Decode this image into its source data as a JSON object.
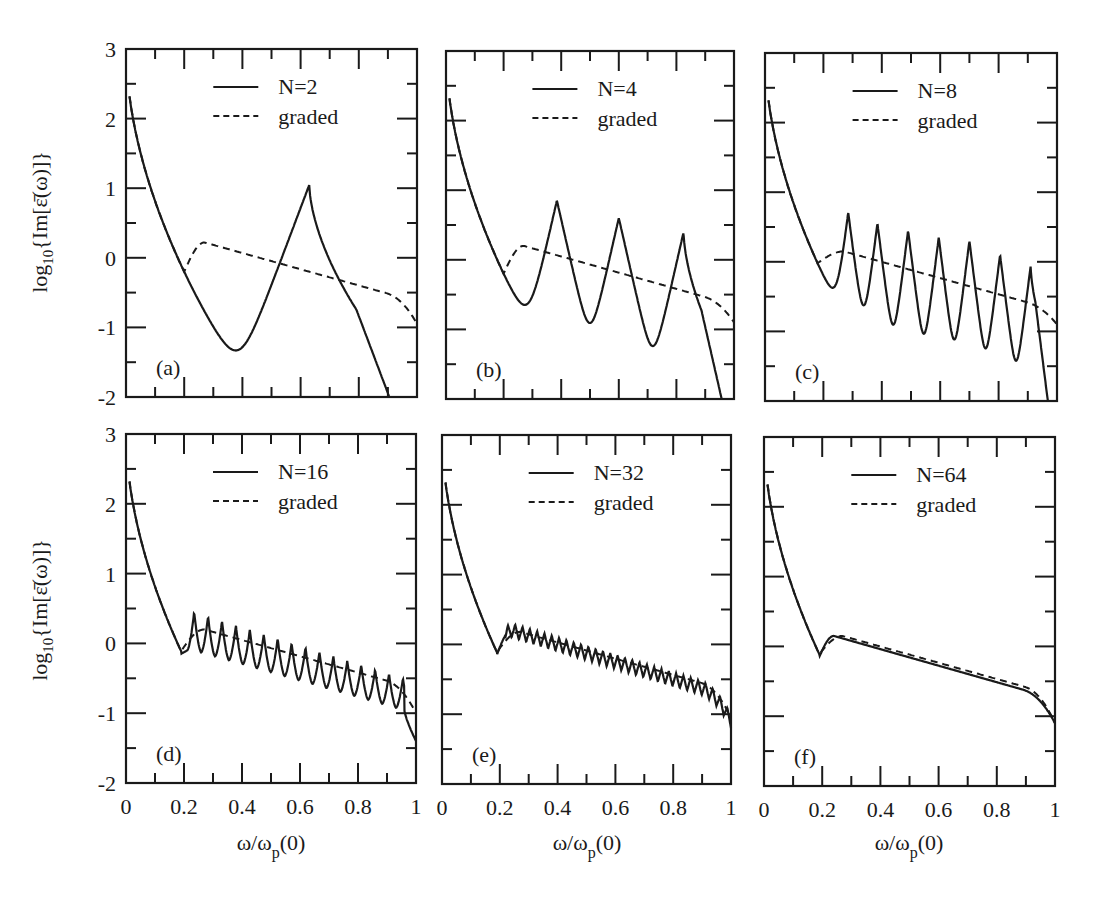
{
  "figure": {
    "ylabel_top": "log10{Im[ε̄(ω)]}",
    "ylabel_bottom": "log10{Im[ε̄(ω)]}",
    "xlabel": "ω/ωp(0)",
    "colors": {
      "line": "#1a1a1a",
      "background": "#ffffff"
    }
  },
  "chart_data": [
    {
      "type": "line",
      "panel": "(a)",
      "title": "",
      "xlabel": "",
      "ylabel": "log10{Im[ε̄(ω)]}",
      "xlim": [
        0,
        1
      ],
      "ylim": [
        -2,
        3
      ],
      "xticks": [
        0,
        0.2,
        0.4,
        0.6,
        0.8,
        1
      ],
      "yticks": [
        -2,
        -1,
        0,
        1,
        2,
        3
      ],
      "legend": [
        "N=2",
        "graded"
      ],
      "legend_position": "upper center",
      "grid": false,
      "series": [
        {
          "name": "N=2",
          "style": "solid",
          "n_peaks": 1,
          "peaks_x": [
            0.63
          ],
          "peaks_y": [
            1.05
          ],
          "min_x": [
            0.44
          ],
          "min_y": [
            -1.05
          ],
          "end_y": -1.9
        },
        {
          "name": "graded",
          "style": "dashed",
          "kink_x": 0.2,
          "kink_y": -0.05,
          "max_x": 0.27,
          "max_y": 0.22,
          "end_y": -0.95
        }
      ]
    },
    {
      "type": "line",
      "panel": "(b)",
      "title": "",
      "xlim": [
        0,
        1
      ],
      "ylim": [
        -2,
        3
      ],
      "xticks": [
        0,
        0.2,
        0.4,
        0.6,
        0.8,
        1
      ],
      "yticks": [
        -2,
        -1,
        0,
        1,
        2,
        3
      ],
      "legend": [
        "N=4",
        "graded"
      ],
      "legend_position": "upper center",
      "grid": false,
      "series": [
        {
          "name": "N=4",
          "style": "solid",
          "n_peaks": 3,
          "peaks_x": [
            0.385,
            0.6,
            0.825
          ],
          "peaks_y": [
            0.85,
            0.6,
            0.4
          ],
          "min_x": [
            0.29,
            0.505,
            0.73
          ],
          "min_y": [
            -0.6,
            -0.85,
            -1.1
          ],
          "end_y": -1.7
        },
        {
          "name": "graded",
          "style": "dashed",
          "kink_x": 0.2,
          "kink_y": -0.05,
          "max_x": 0.27,
          "max_y": 0.2,
          "end_y": -0.9
        }
      ]
    },
    {
      "type": "line",
      "panel": "(c)",
      "title": "",
      "xlim": [
        0,
        1
      ],
      "ylim": [
        -2,
        3
      ],
      "xticks": [
        0,
        0.2,
        0.4,
        0.6,
        0.8,
        1
      ],
      "yticks": [
        -2,
        -1,
        0,
        1,
        2,
        3
      ],
      "legend": [
        "N=8",
        "graded"
      ],
      "legend_position": "upper center",
      "grid": false,
      "series": [
        {
          "name": "N=8",
          "style": "solid",
          "n_peaks": 7,
          "peaks_x": [
            0.285,
            0.385,
            0.49,
            0.595,
            0.7,
            0.805,
            0.91
          ],
          "peaks_y": [
            0.7,
            0.55,
            0.45,
            0.35,
            0.3,
            0.1,
            -0.05
          ],
          "min_x": [
            0.215,
            0.33,
            0.435,
            0.54,
            0.645,
            0.75,
            0.855
          ],
          "min_y": [
            -0.35,
            -0.65,
            -0.85,
            -1.05,
            -1.2,
            -1.3,
            -1.45
          ],
          "end_y": -1.55
        },
        {
          "name": "graded",
          "style": "dashed",
          "kink_x": 0.18,
          "kink_y": -0.05,
          "max_x": 0.27,
          "max_y": 0.15,
          "end_y": -0.9
        }
      ]
    },
    {
      "type": "line",
      "panel": "(d)",
      "title": "",
      "xlabel": "ω/ωp(0)",
      "ylabel": "log10{Im[ε̄(ω)]}",
      "xlim": [
        0,
        1
      ],
      "ylim": [
        -2,
        3
      ],
      "xticks": [
        0,
        0.2,
        0.4,
        0.6,
        0.8,
        1
      ],
      "yticks": [
        -2,
        -1,
        0,
        1,
        2,
        3
      ],
      "legend": [
        "N=16",
        "graded"
      ],
      "legend_position": "upper center",
      "grid": false,
      "series": [
        {
          "name": "N=16",
          "style": "solid",
          "n_peaks": 16,
          "peak_range_x": [
            0.235,
            0.955
          ],
          "peak_start_y": 0.45,
          "peak_end_y": -0.5,
          "trough_start_y": -0.1,
          "trough_end_y": -0.95,
          "min_x": 0.19,
          "min_y": -0.15,
          "end_y": -1.3
        },
        {
          "name": "graded",
          "style": "dashed",
          "kink_x": 0.19,
          "max_y": 0.2,
          "end_y": -1.0
        }
      ]
    },
    {
      "type": "line",
      "panel": "(e)",
      "title": "",
      "xlabel": "ω/ωp(0)",
      "xlim": [
        0,
        1
      ],
      "ylim": [
        -2,
        3
      ],
      "xticks": [
        0,
        0.2,
        0.4,
        0.6,
        0.8,
        1
      ],
      "yticks": [
        -2,
        -1,
        0,
        1,
        2,
        3
      ],
      "legend": [
        "N=32",
        "graded"
      ],
      "legend_position": "upper center",
      "grid": false,
      "series": [
        {
          "name": "N=32",
          "style": "solid",
          "n_peaks": 32,
          "amplitude": 0.1,
          "min_x": 0.19,
          "min_y": -0.15,
          "max_y": 0.2,
          "end_y": -1.1
        },
        {
          "name": "graded",
          "style": "dashed",
          "kink_x": 0.19,
          "max_y": 0.18,
          "end_y": -1.05
        }
      ]
    },
    {
      "type": "line",
      "panel": "(f)",
      "title": "",
      "xlabel": "ω/ωp(0)",
      "xlim": [
        0,
        1
      ],
      "ylim": [
        -2,
        3
      ],
      "xticks": [
        0,
        0.2,
        0.4,
        0.6,
        0.8,
        1
      ],
      "yticks": [
        -2,
        -1,
        0,
        1,
        2,
        3
      ],
      "legend": [
        "N=64",
        "graded"
      ],
      "legend_position": "upper center",
      "grid": false,
      "series": [
        {
          "name": "N=64",
          "style": "solid",
          "n_peaks": 64,
          "amplitude": 0.0,
          "min_x": 0.19,
          "min_y": -0.15,
          "max_x": 0.25,
          "max_y": 0.15,
          "end_y": -1.1
        },
        {
          "name": "graded",
          "style": "dashed",
          "kink_x": 0.19,
          "max_y": 0.15,
          "end_y": -1.1
        }
      ]
    }
  ],
  "panels": [
    {
      "id": "a",
      "label": "(a)",
      "legend_solid": "N=2",
      "legend_dashed": "graded"
    },
    {
      "id": "b",
      "label": "(b)",
      "legend_solid": "N=4",
      "legend_dashed": "graded"
    },
    {
      "id": "c",
      "label": "(c)",
      "legend_solid": "N=8",
      "legend_dashed": "graded"
    },
    {
      "id": "d",
      "label": "(d)",
      "legend_solid": "N=16",
      "legend_dashed": "graded"
    },
    {
      "id": "e",
      "label": "(e)",
      "legend_solid": "N=32",
      "legend_dashed": "graded"
    },
    {
      "id": "f",
      "label": "(f)",
      "legend_solid": "N=64",
      "legend_dashed": "graded"
    }
  ],
  "axes": {
    "ytick_labels": [
      "3",
      "2",
      "1",
      "0",
      "-1",
      "-2"
    ],
    "xtick_labels": [
      "0",
      "0.2",
      "0.4",
      "0.6",
      "0.8",
      "1"
    ]
  }
}
